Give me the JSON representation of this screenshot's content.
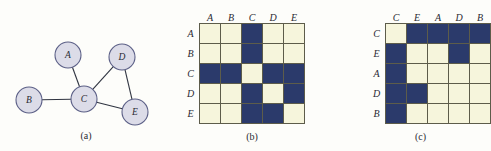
{
  "figure": {
    "panels": [
      {
        "id": "a",
        "caption": "(a)",
        "kind": "graph"
      },
      {
        "id": "b",
        "caption": "(b)",
        "kind": "matrix"
      },
      {
        "id": "c",
        "caption": "(c)",
        "kind": "matrix"
      }
    ]
  },
  "graph": {
    "caption": "(a)",
    "nodes": [
      {
        "id": "A",
        "label": "A",
        "x": 68,
        "y": 55
      },
      {
        "id": "B",
        "label": "B",
        "x": 29,
        "y": 100
      },
      {
        "id": "C",
        "label": "C",
        "x": 84,
        "y": 99
      },
      {
        "id": "D",
        "label": "D",
        "x": 122,
        "y": 57
      },
      {
        "id": "E",
        "label": "E",
        "x": 135,
        "y": 112
      }
    ],
    "edges": [
      {
        "source": "A",
        "target": "C"
      },
      {
        "source": "B",
        "target": "C"
      },
      {
        "source": "C",
        "target": "D"
      },
      {
        "source": "C",
        "target": "E"
      },
      {
        "source": "D",
        "target": "E"
      }
    ],
    "node_radius": 13,
    "node_fill": "#dcdce8",
    "node_stroke": "#5b5f86",
    "edge_stroke": "#2f3440"
  },
  "matrix_b": {
    "caption": "(b)",
    "col_headers": [
      "A",
      "B",
      "C",
      "D",
      "E"
    ],
    "row_headers": [
      "A",
      "B",
      "C",
      "D",
      "E"
    ],
    "cells": [
      [
        0,
        0,
        1,
        0,
        0
      ],
      [
        0,
        0,
        1,
        0,
        0
      ],
      [
        1,
        1,
        0,
        1,
        1
      ],
      [
        0,
        0,
        1,
        0,
        1
      ],
      [
        0,
        0,
        1,
        1,
        0
      ]
    ]
  },
  "matrix_c": {
    "caption": "(c)",
    "col_headers": [
      "C",
      "E",
      "A",
      "D",
      "B"
    ],
    "row_headers": [
      "C",
      "E",
      "A",
      "D",
      "B"
    ],
    "cells": [
      [
        0,
        1,
        1,
        1,
        1
      ],
      [
        1,
        0,
        0,
        1,
        0
      ],
      [
        1,
        0,
        0,
        0,
        0
      ],
      [
        1,
        1,
        0,
        0,
        0
      ],
      [
        1,
        0,
        0,
        0,
        0
      ]
    ]
  },
  "colors": {
    "cell_on": "#2b3a6b",
    "cell_off": "#f6f5dc",
    "grid_line": "#5d5c4a",
    "background": "#fdfdfa"
  }
}
